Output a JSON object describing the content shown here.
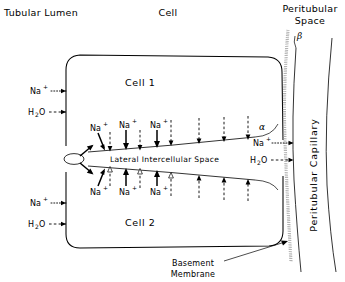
{
  "figure": {
    "title_regions": {
      "tubular_lumen": "Tubular Lumen",
      "cell": "Cell",
      "peritubular_space_line1": "Peritubular",
      "peritubular_space_line2": "Space"
    },
    "cells": {
      "cell1": "Cell 1",
      "cell2": "Cell 2"
    },
    "lateral_space_label": "Lateral Intercellular Space",
    "greek_labels": {
      "alpha": "α",
      "beta": "β"
    },
    "basement_membrane": {
      "line1": "Basement",
      "line2": "Membrane"
    },
    "capillary_label": "Peritubular  Capillary",
    "species": {
      "sodium_base": "Na",
      "sodium_charge": "+",
      "water_base": "H",
      "water_sub": "2",
      "water_tail": "O"
    },
    "lumen_entry_arrows": [
      {
        "species": "Na+",
        "style": "dotted",
        "y": 91
      },
      {
        "species": "H2O",
        "style": "dashed",
        "y": 112
      },
      {
        "species": "Na+",
        "style": "dotted",
        "y": 203
      },
      {
        "species": "H2O",
        "style": "dashed",
        "y": 224
      }
    ],
    "capillary_exit_arrows": [
      {
        "species": "Na+",
        "style": "dotted",
        "y": 143
      },
      {
        "species": "H2O",
        "style": "dashed",
        "y": 160
      }
    ],
    "junction_arrows_count": 2,
    "upper_sodium_arrows": [
      {
        "x": 97,
        "label": "Na+"
      },
      {
        "x": 126,
        "label": "Na+"
      },
      {
        "x": 157,
        "label": "Na+"
      }
    ],
    "lower_sodium_arrows": [
      {
        "x": 97,
        "label": "Na+"
      },
      {
        "x": 126,
        "label": "Na+"
      },
      {
        "x": 157,
        "label": "Na+"
      }
    ],
    "upper_water_arrows_x": [
      110,
      140,
      171,
      199,
      224,
      248,
      272
    ],
    "lower_water_arrows_x": [
      110,
      140,
      171,
      199,
      224,
      248,
      272
    ],
    "colors": {
      "ink": "#000000",
      "membrane_gray": "#9a9a9a",
      "background": "#ffffff"
    }
  }
}
